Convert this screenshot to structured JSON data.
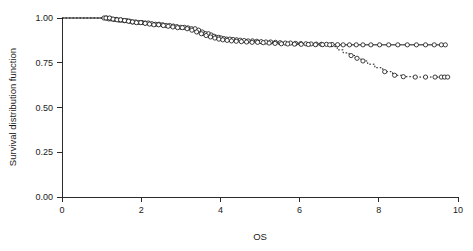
{
  "chart_data": {
    "type": "line",
    "title": "",
    "subtitle": "",
    "xlabel": "OS",
    "ylabel": "Survival distribution function",
    "xlim": [
      0,
      10
    ],
    "ylim": [
      0,
      1
    ],
    "xticks": [
      0,
      2,
      4,
      6,
      8,
      10
    ],
    "xtick_labels": [
      "0",
      "2",
      "4",
      "6",
      "8",
      "10"
    ],
    "yticks": [
      0.0,
      0.25,
      0.5,
      0.75,
      1.0
    ],
    "ytick_labels": [
      "0.00",
      "0.25",
      "0.50",
      "0.75",
      "1.00"
    ],
    "grid": false,
    "legend": "none",
    "plot_style": "kaplan-meier step function with censoring markers",
    "marker": "open-circle",
    "series": [
      {
        "name": "curve-solid",
        "linestyle": "solid",
        "color": "#111111",
        "final_value": 0.85,
        "x": [
          0.0,
          1.05,
          1.15,
          1.28,
          1.4,
          1.52,
          1.65,
          1.78,
          1.9,
          2.05,
          2.2,
          2.35,
          2.5,
          2.62,
          2.75,
          2.88,
          3.0,
          3.12,
          3.25,
          3.38,
          3.5,
          3.62,
          3.72,
          3.82,
          3.9,
          3.98,
          4.05,
          4.15,
          4.25,
          4.35,
          4.45,
          4.58,
          4.7,
          4.85,
          5.0,
          5.15,
          5.3,
          5.45,
          5.6,
          5.78,
          5.95,
          6.1,
          6.25,
          6.4,
          6.55,
          6.7,
          6.85,
          7.0,
          7.2,
          7.45,
          7.7,
          8.0,
          8.3,
          8.6,
          8.9,
          9.2,
          9.5,
          9.7
        ],
        "y": [
          1.0,
          1.0,
          0.995,
          0.992,
          0.988,
          0.985,
          0.982,
          0.978,
          0.975,
          0.972,
          0.968,
          0.965,
          0.962,
          0.958,
          0.955,
          0.952,
          0.948,
          0.945,
          0.94,
          0.932,
          0.922,
          0.912,
          0.905,
          0.898,
          0.892,
          0.888,
          0.885,
          0.882,
          0.88,
          0.878,
          0.876,
          0.874,
          0.872,
          0.87,
          0.868,
          0.866,
          0.864,
          0.862,
          0.86,
          0.858,
          0.857,
          0.856,
          0.855,
          0.854,
          0.853,
          0.852,
          0.851,
          0.85,
          0.85,
          0.85,
          0.85,
          0.85,
          0.85,
          0.85,
          0.85,
          0.85,
          0.85,
          0.85
        ]
      },
      {
        "name": "curve-dashed",
        "linestyle": "dashed",
        "color": "#111111",
        "final_value": 0.67,
        "x": [
          0.0,
          1.1,
          1.25,
          1.38,
          1.5,
          1.62,
          1.75,
          1.88,
          2.0,
          2.15,
          2.3,
          2.45,
          2.6,
          2.75,
          2.9,
          3.05,
          3.18,
          3.3,
          3.42,
          3.55,
          3.68,
          3.8,
          3.92,
          4.02,
          4.12,
          4.22,
          4.35,
          4.5,
          4.65,
          4.8,
          4.95,
          5.1,
          5.28,
          5.45,
          5.62,
          5.8,
          6.0,
          6.2,
          6.4,
          6.6,
          6.8,
          6.95,
          7.1,
          7.25,
          7.4,
          7.55,
          7.72,
          7.9,
          8.1,
          8.35,
          8.6,
          8.9,
          9.15,
          9.4,
          9.62,
          9.72
        ],
        "y": [
          1.0,
          1.0,
          0.994,
          0.99,
          0.986,
          0.982,
          0.978,
          0.974,
          0.97,
          0.966,
          0.962,
          0.958,
          0.954,
          0.95,
          0.946,
          0.94,
          0.932,
          0.922,
          0.912,
          0.902,
          0.894,
          0.888,
          0.882,
          0.878,
          0.875,
          0.872,
          0.87,
          0.868,
          0.866,
          0.864,
          0.862,
          0.86,
          0.858,
          0.856,
          0.855,
          0.854,
          0.853,
          0.852,
          0.851,
          0.85,
          0.84,
          0.822,
          0.805,
          0.79,
          0.775,
          0.76,
          0.742,
          0.722,
          0.7,
          0.68,
          0.672,
          0.67,
          0.67,
          0.67,
          0.67,
          0.67
        ]
      }
    ],
    "censor_points_solid_x": [
      1.06,
      1.12,
      1.18,
      1.24,
      1.31,
      1.37,
      1.44,
      1.5,
      1.57,
      1.64,
      1.71,
      1.78,
      1.86,
      1.94,
      2.02,
      2.1,
      2.18,
      2.27,
      2.36,
      2.45,
      2.54,
      2.63,
      2.72,
      2.81,
      2.9,
      3.0,
      3.09,
      3.18,
      3.27,
      3.36,
      3.45,
      3.54,
      3.63,
      3.7,
      3.77,
      3.84,
      3.9,
      3.96,
      4.02,
      4.09,
      4.16,
      4.24,
      4.32,
      4.41,
      4.5,
      4.6,
      4.7,
      4.81,
      4.92,
      5.03,
      5.15,
      5.27,
      5.39,
      5.51,
      5.64,
      5.77,
      5.9,
      6.03,
      6.16,
      6.29,
      6.42,
      6.55,
      6.68,
      6.82,
      6.96,
      7.1,
      7.26,
      7.43,
      7.6,
      7.8,
      8.02,
      8.25,
      8.48,
      8.72,
      8.95,
      9.18,
      9.4,
      9.58,
      9.68
    ],
    "censor_points_dashed_x": [
      1.11,
      1.2,
      1.29,
      1.39,
      1.48,
      1.58,
      1.68,
      1.78,
      1.88,
      1.99,
      2.1,
      2.21,
      2.32,
      2.44,
      2.56,
      2.68,
      2.8,
      2.92,
      3.04,
      3.16,
      3.28,
      3.4,
      3.52,
      3.64,
      3.75,
      3.86,
      3.96,
      4.06,
      4.17,
      4.28,
      4.4,
      4.53,
      4.66,
      4.8,
      4.94,
      5.08,
      5.23,
      5.38,
      5.54,
      5.7,
      5.87,
      6.04,
      6.22,
      6.4,
      6.58,
      6.76,
      7.3,
      7.45,
      7.6,
      8.15,
      8.4,
      8.62,
      8.92,
      9.18,
      9.42,
      9.58,
      9.66,
      9.74
    ]
  },
  "axes": {
    "ylabel": "Survival distribution function",
    "xlabel": "OS"
  },
  "ticks": {
    "y": [
      "1.00",
      "0.75",
      "0.50",
      "0.25",
      "0.00"
    ],
    "x": [
      "0",
      "2",
      "4",
      "6",
      "8",
      "10"
    ]
  }
}
